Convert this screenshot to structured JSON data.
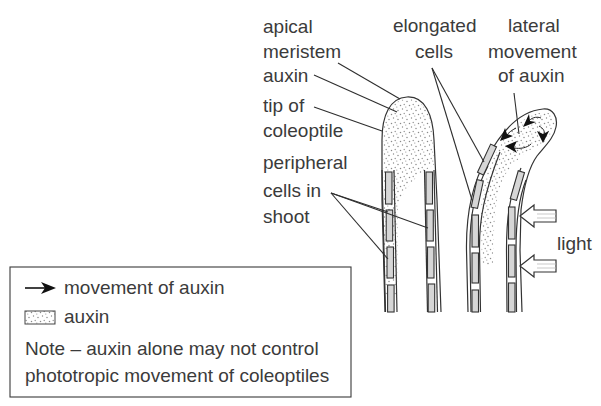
{
  "diagram": {
    "labels": {
      "apical_meristem": [
        "apical",
        "meristem"
      ],
      "auxin": "auxin",
      "tip_of_coleoptile": [
        "tip of",
        "coleoptile"
      ],
      "peripheral_cells": [
        "peripheral",
        "cells in",
        "shoot"
      ],
      "elongated_cells": [
        "elongated",
        "cells"
      ],
      "lateral_movement": [
        "lateral",
        "movement",
        "of auxin"
      ],
      "light": "light"
    },
    "colors": {
      "text": "#3b3b3b",
      "line": "#333333",
      "cell_fill": "#d6d6d6",
      "auxin_dots": "#8a8a8a"
    }
  },
  "legend": {
    "arrow_label": "movement of auxin",
    "auxin_label": "auxin",
    "note_line1": "Note – auxin alone may not control",
    "note_line2": "phototropic movement of coleoptiles",
    "icons": [
      "arrow-right-icon",
      "stipple-swatch-icon"
    ]
  }
}
